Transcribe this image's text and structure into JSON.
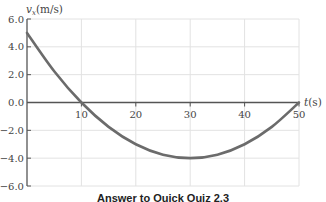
{
  "chart_data": {
    "type": "line",
    "title": "",
    "xlabel": "t(s)",
    "ylabel": "v_x(m/s)",
    "xlim": [
      0,
      50
    ],
    "ylim": [
      -6.0,
      6.0
    ],
    "x_ticks": [
      "10",
      "20",
      "30",
      "40",
      "50"
    ],
    "y_ticks": [
      "6.0",
      "4.0",
      "2.0",
      "0.0",
      "-2.0",
      "-4.0",
      "-6.0"
    ],
    "grid": true,
    "series": [
      {
        "name": "v_x",
        "color": "#6b6b6b",
        "x": [
          0,
          5,
          10,
          15,
          20,
          25,
          30,
          35,
          40,
          45,
          50
        ],
        "values": [
          5.0,
          2.25,
          0.0,
          -1.75,
          -3.0,
          -3.75,
          -4.0,
          -3.75,
          -3.0,
          -1.75,
          0.0
        ]
      }
    ],
    "caption": "Answer to Quick Quiz 2.3"
  }
}
